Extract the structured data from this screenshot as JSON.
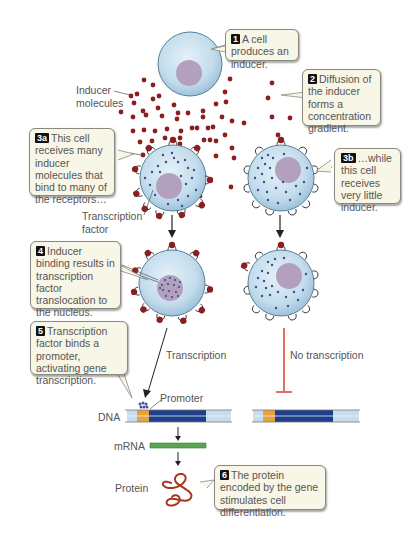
{
  "callouts": {
    "c1": {
      "num": "1",
      "text": "A cell produces an inducer."
    },
    "c2": {
      "num": "2",
      "text": "Diffusion of the inducer forms a concentration gradient."
    },
    "c3a": {
      "num": "3a",
      "text": "This cell receives many inducer molecules that bind to many of the receptors…"
    },
    "c3b": {
      "num": "3b",
      "text": "…while this cell receives very little inducer."
    },
    "c4": {
      "num": "4",
      "text": "Inducer binding results in transcription factor translocation to the nucleus."
    },
    "c5": {
      "num": "5",
      "text": "Transcription factor binds a promoter, activating gene transcription."
    },
    "c6": {
      "num": "6",
      "text": "The protein encoded by the gene stimulates cell differentiation."
    }
  },
  "labels": {
    "inducer_molecules": "Inducer molecules",
    "transcription_factor": "Transcription factor",
    "transcription": "Transcription",
    "no_transcription": "No transcription",
    "promoter": "Promoter",
    "dna": "DNA",
    "mrna": "mRNA",
    "protein": "Protein"
  },
  "colors": {
    "cell_fill": "#c9e1ef",
    "nucleus": "#b3a0bf",
    "inducer": "#8b1e1e",
    "tf_dot": "#3b4f8a",
    "dna_dark": "#1e3f8a",
    "dna_light": "#c8dcef",
    "promoter": "#e9a23b",
    "mrna": "#5aa552",
    "inhibit": "#e07060"
  }
}
